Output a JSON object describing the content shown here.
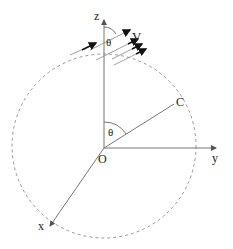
{
  "diagram": {
    "labels": {
      "z_axis": "z",
      "y_axis": "y",
      "x_axis": "x",
      "origin": "O",
      "point_c": "C",
      "velocity": "V",
      "theta_top": "θ",
      "theta_center": "θ"
    },
    "colors": {
      "axis": "#777777",
      "circle": "#999999",
      "text": "#222222",
      "arrow": "#222222"
    }
  }
}
